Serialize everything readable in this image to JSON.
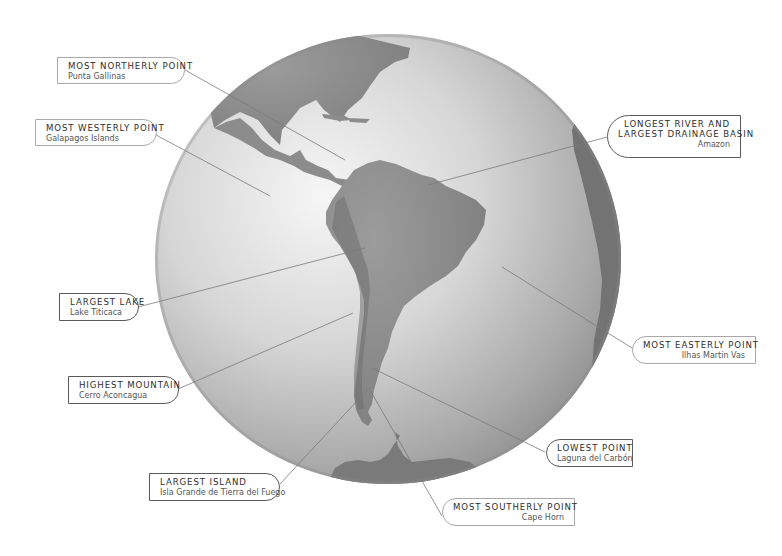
{
  "diagram": {
    "colors": {
      "background": "#ffffff",
      "ocean_highlight": "#f4f4f4",
      "ocean_mid": "#c9c9c9",
      "ocean_shadow": "#8d8d8d",
      "land": "#8a8a8a",
      "land_dark": "#6e6e6e",
      "leader_line": "#7a7a7a",
      "box_border_light": "#a8a8a8",
      "box_border_dark": "#5a5a5a"
    },
    "callouts": [
      {
        "id": "most-northerly",
        "title": "MOST NORTHERLY POINT",
        "value": "Punta Gallinas"
      },
      {
        "id": "most-westerly",
        "title": "MOST WESTERLY POINT",
        "value": "Galapagos Islands"
      },
      {
        "id": "longest-river",
        "title_line1": "LONGEST RIVER AND",
        "title_line2": "LARGEST DRAINAGE BASIN",
        "value": "Amazon"
      },
      {
        "id": "largest-lake",
        "title": "LARGEST LAKE",
        "value": "Lake Titicaca"
      },
      {
        "id": "most-easterly",
        "title": "MOST EASTERLY POINT",
        "value": "Ilhas Martin Vas"
      },
      {
        "id": "highest-mountain",
        "title": "HIGHEST MOUNTAIN",
        "value": "Cerro Aconcagua"
      },
      {
        "id": "lowest-point",
        "title": "LOWEST POINT",
        "value": "Laguna del Carbón"
      },
      {
        "id": "largest-island",
        "title": "LARGEST ISLAND",
        "value": "Isla Grande de Tierra del Fuego"
      },
      {
        "id": "most-southerly",
        "title": "MOST SOUTHERLY POINT",
        "value": "Cape Horn"
      }
    ]
  }
}
